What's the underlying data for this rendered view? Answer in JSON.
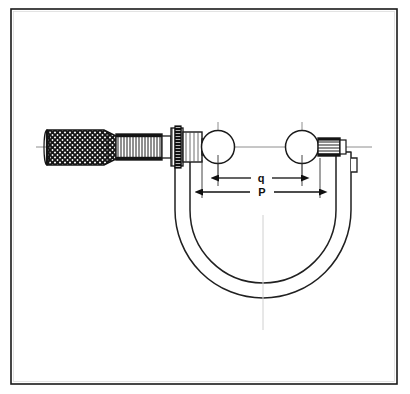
{
  "figure": {
    "kind": "engineering-line-drawing",
    "border": {
      "present": true,
      "color": "#1a1a1a",
      "style": "thin-rectangular-frame"
    },
    "background_color": "#ffffff",
    "line_color": "#101010",
    "centerline_color": "#8a8a8a"
  },
  "labels": {
    "dimension_q": "q",
    "dimension_P": "P"
  },
  "dimensions": [
    {
      "id": "q",
      "label": "q",
      "type": "double-headed-arrow",
      "description": "inner span between sphere centres"
    },
    {
      "id": "P",
      "label": "P",
      "type": "double-headed-arrow",
      "description": "outer span across both spheres"
    }
  ],
  "parts": [
    {
      "id": "knurled-thimble",
      "label": "knurled thimble"
    },
    {
      "id": "graduated-spindle",
      "label": "graduated spindle"
    },
    {
      "id": "lock-nut",
      "label": "lock nut"
    },
    {
      "id": "sleeve-barrel",
      "label": "sleeve barrel"
    },
    {
      "id": "left-sphere",
      "label": "left sphere"
    },
    {
      "id": "right-sphere",
      "label": "right sphere"
    },
    {
      "id": "anvil-block",
      "label": "anvil block"
    },
    {
      "id": "c-frame",
      "label": "C frame"
    },
    {
      "id": "axis-centerline",
      "label": "axis centerline"
    }
  ]
}
